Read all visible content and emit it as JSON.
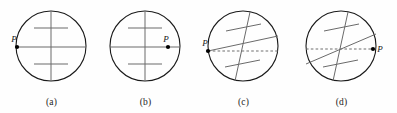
{
  "figure": {
    "type": "diagram",
    "panel_count": 4,
    "stroke_color": "#1a1a1a",
    "axis_color": "#5a5a5a",
    "dashed_color": "#6b6b6b",
    "point_color": "#000000",
    "background_color": "#ffffff"
  },
  "panels": [
    {
      "id": "a",
      "caption": "(a)",
      "point_label": "P",
      "point_label_position": "above-right-of-dot",
      "point_location": "left edge, on horizontal diameter",
      "axis_tilt_degrees": 0,
      "has_dashed_line": false,
      "has_solid_chord": true,
      "solid_chord_orientation": "horizontal",
      "circle": {
        "cx": 49,
        "cy": 46,
        "r": 35
      },
      "point": {
        "x": 15,
        "y": 47
      },
      "label_offset": {
        "dx": -2,
        "dy": -5
      },
      "cross": {
        "angle_degrees": 0,
        "stem": {
          "x1": 49,
          "y1": 11,
          "x2": 49,
          "y2": 81
        },
        "bar_upper": {
          "x1": 32,
          "y1": 28,
          "x2": 66,
          "y2": 28
        },
        "bar_lower": {
          "x1": 32,
          "y1": 64,
          "x2": 66,
          "y2": 64
        }
      },
      "chord": {
        "x1": 15,
        "y1": 47,
        "x2": 84,
        "y2": 47
      }
    },
    {
      "id": "b",
      "caption": "(b)",
      "point_label": "P",
      "point_label_position": "above-left-of-dot",
      "point_location": "inside circle, right of center on horizontal diameter",
      "axis_tilt_degrees": 0,
      "has_dashed_line": false,
      "has_solid_chord": true,
      "solid_chord_orientation": "horizontal",
      "circle": {
        "cx": 49,
        "cy": 46,
        "r": 35
      },
      "point": {
        "x": 72,
        "y": 47
      },
      "label_offset": {
        "dx": -2,
        "dy": -5
      },
      "cross": {
        "angle_degrees": 0,
        "stem": {
          "x1": 49,
          "y1": 11,
          "x2": 49,
          "y2": 81
        },
        "bar_upper": {
          "x1": 32,
          "y1": 28,
          "x2": 66,
          "y2": 28
        },
        "bar_lower": {
          "x1": 32,
          "y1": 64,
          "x2": 66,
          "y2": 64
        }
      },
      "chord": {
        "x1": 14,
        "y1": 47,
        "x2": 84,
        "y2": 47
      }
    },
    {
      "id": "c",
      "caption": "(c)",
      "point_label": "P",
      "point_label_position": "above-left-of-dot",
      "point_location": "left edge, on horizontal dashed line",
      "axis_tilt_degrees": 12,
      "has_dashed_line": true,
      "has_solid_chord": true,
      "solid_chord_orientation": "tilted upward to the right",
      "circle": {
        "cx": 49,
        "cy": 46,
        "r": 35
      },
      "point": {
        "x": 14,
        "y": 51
      },
      "label_offset": {
        "dx": -3,
        "dy": -5
      },
      "cross": {
        "angle_degrees": 12,
        "stem": {
          "x1": 56,
          "y1": 12,
          "x2": 41,
          "y2": 81
        },
        "bar_upper": {
          "x1": 32,
          "y1": 31,
          "x2": 67,
          "y2": 24
        },
        "bar_lower": {
          "x1": 31,
          "y1": 67,
          "x2": 66,
          "y2": 60
        }
      },
      "chord": {
        "x1": 14,
        "y1": 51,
        "x2": 84,
        "y2": 36
      },
      "dashed": {
        "x1": 14,
        "y1": 51,
        "x2": 84,
        "y2": 51
      }
    },
    {
      "id": "d",
      "caption": "(d)",
      "point_label": "P",
      "point_label_position": "right-of-dot",
      "point_location": "right edge, on horizontal dashed line",
      "axis_tilt_degrees": 12,
      "has_dashed_line": true,
      "has_solid_chord": true,
      "solid_chord_orientation": "tilted upward to the right",
      "circle": {
        "cx": 49,
        "cy": 46,
        "r": 35
      },
      "point": {
        "x": 81,
        "y": 49
      },
      "label_offset": {
        "dx": 6,
        "dy": 3
      },
      "cross": {
        "angle_degrees": 12,
        "stem": {
          "x1": 56,
          "y1": 12,
          "x2": 41,
          "y2": 81
        },
        "bar_upper": {
          "x1": 32,
          "y1": 31,
          "x2": 67,
          "y2": 24
        },
        "bar_lower": {
          "x1": 31,
          "y1": 67,
          "x2": 66,
          "y2": 60
        }
      },
      "chord": {
        "x1": 14,
        "y1": 64,
        "x2": 84,
        "y2": 34
      },
      "dashed": {
        "x1": 14,
        "y1": 49,
        "x2": 81,
        "y2": 49
      }
    }
  ]
}
